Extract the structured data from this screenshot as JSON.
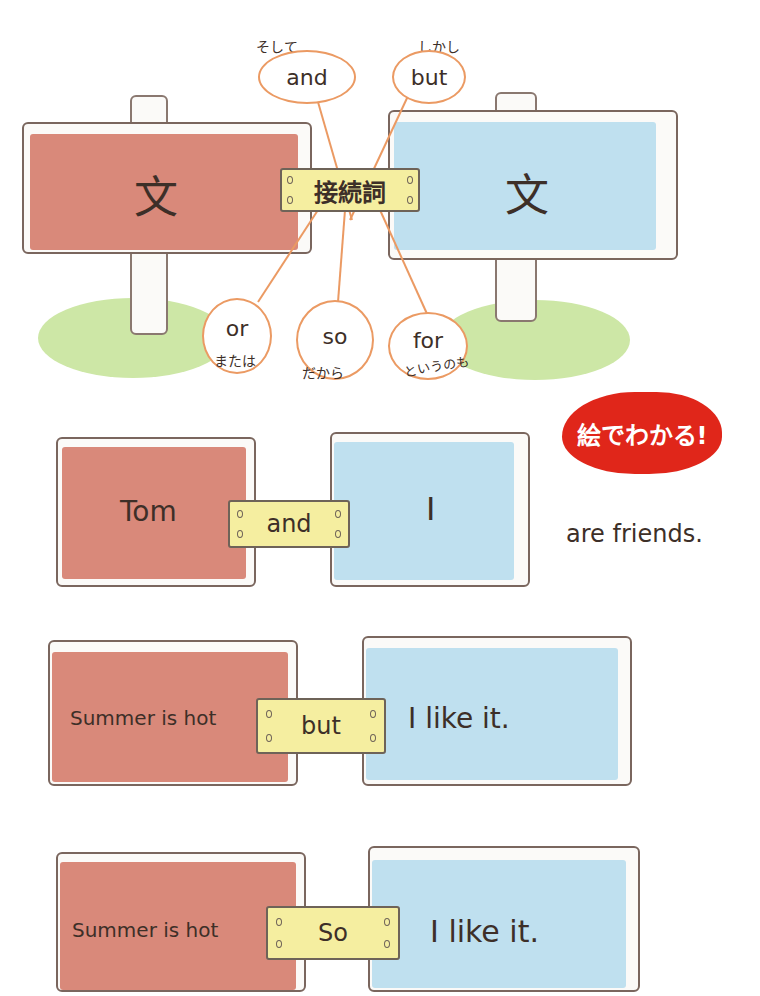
{
  "colors": {
    "left_board": "#d9897a",
    "right_board": "#bfe0ef",
    "plate": "#f5eea0",
    "bubble_outline": "#eb9a63",
    "badge": "#e0261a",
    "ink": "#3d2f28"
  },
  "top_diagram": {
    "left_sign": {
      "label": "文"
    },
    "right_sign": {
      "label": "文"
    },
    "center_plate": {
      "label": "接続詞"
    },
    "bubbles": [
      {
        "word": "and",
        "meaning": "そして"
      },
      {
        "word": "but",
        "meaning": "しかし"
      },
      {
        "word": "or",
        "meaning": "または"
      },
      {
        "word": "so",
        "meaning": "だから"
      },
      {
        "word": "for",
        "meaning": "というのも"
      }
    ]
  },
  "badge": {
    "label": "絵でわかる!"
  },
  "examples": [
    {
      "left": "Tom",
      "connector": "and",
      "right": "I",
      "suffix": "are friends."
    },
    {
      "left": "Summer is hot",
      "connector": "but",
      "right": "I like it."
    },
    {
      "left": "Summer is hot",
      "connector": "So",
      "right": "I like it."
    }
  ]
}
